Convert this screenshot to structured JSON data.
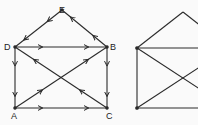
{
  "left_figure": {
    "labels": {
      "E": "E",
      "D": "D",
      "B": "B",
      "A": "A",
      "C": "C"
    },
    "nodes": {
      "E": [
        62,
        10
      ],
      "D": [
        15,
        47
      ],
      "B": [
        107,
        47
      ],
      "A": [
        15,
        108
      ],
      "C": [
        107,
        108
      ]
    },
    "directed_edges": [
      [
        "D",
        "B"
      ],
      [
        "B",
        "E"
      ],
      [
        "E",
        "D"
      ],
      [
        "D",
        "A"
      ],
      [
        "A",
        "C"
      ],
      [
        "B",
        "C"
      ],
      [
        "A",
        "B"
      ],
      [
        "C",
        "D"
      ]
    ]
  },
  "right_figure": {
    "nodes": {
      "apex": [
        183,
        12
      ],
      "TL": [
        137,
        48
      ],
      "BL": [
        137,
        108
      ],
      "TR": [
        229,
        48
      ],
      "BR": [
        229,
        108
      ]
    },
    "edges": [
      [
        "TL",
        "apex"
      ],
      [
        "apex",
        "TR"
      ],
      [
        "TL",
        "TR"
      ],
      [
        "TL",
        "BL"
      ],
      [
        "BL",
        "BR"
      ],
      [
        "TL",
        "BR"
      ],
      [
        "BL",
        "TR"
      ]
    ]
  },
  "colors": {
    "line": "#2a2a2a",
    "background": "#fafafa"
  }
}
